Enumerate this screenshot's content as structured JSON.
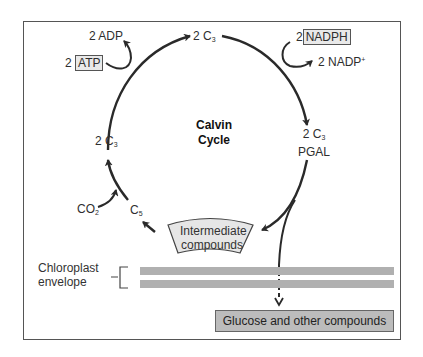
{
  "diagram": {
    "title_line1": "Calvin",
    "title_line2": "Cycle",
    "inputs": {
      "atp_coef": "2",
      "atp": "ATP",
      "adp": "2 ADP",
      "nadph_coef": "2",
      "nadph": "NADPH",
      "nadp": "2 NADP",
      "nadp_charge": "+",
      "co2": "CO",
      "co2_sub": "2"
    },
    "nodes": {
      "top_c3": "2 C",
      "top_c3_sub": "3",
      "pgal_c3": "2 C",
      "pgal_c3_sub": "3",
      "pgal": "PGAL",
      "left_c3": "2 C",
      "left_c3_sub": "3",
      "c5": "C",
      "c5_sub": "5"
    },
    "intermediate_line1": "Intermediate",
    "intermediate_line2": "compounds",
    "envelope_line1": "Chloroplast",
    "envelope_line2": "envelope",
    "output": "Glucose and other compounds",
    "colors": {
      "line": "#2a2a2a",
      "membrane": "#b0b0b0",
      "box_fill": "#bcbcbc",
      "inter_fill": "#e6e6e6"
    }
  }
}
